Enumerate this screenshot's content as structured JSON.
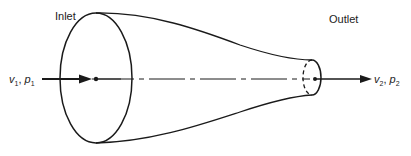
{
  "diagram": {
    "type": "nozzle-flow",
    "labels": {
      "inlet": "Inlet",
      "outlet": "Outlet"
    },
    "inlet_state": {
      "velocity_symbol": "v",
      "velocity_subscript": "1",
      "separator": ", ",
      "pressure_symbol": "p",
      "pressure_subscript": "1"
    },
    "outlet_state": {
      "velocity_symbol": "v",
      "velocity_subscript": "2",
      "separator": ", ",
      "pressure_symbol": "p",
      "pressure_subscript": "2"
    },
    "colors": {
      "line": "#1a1a1a",
      "background": "#ffffff"
    }
  }
}
